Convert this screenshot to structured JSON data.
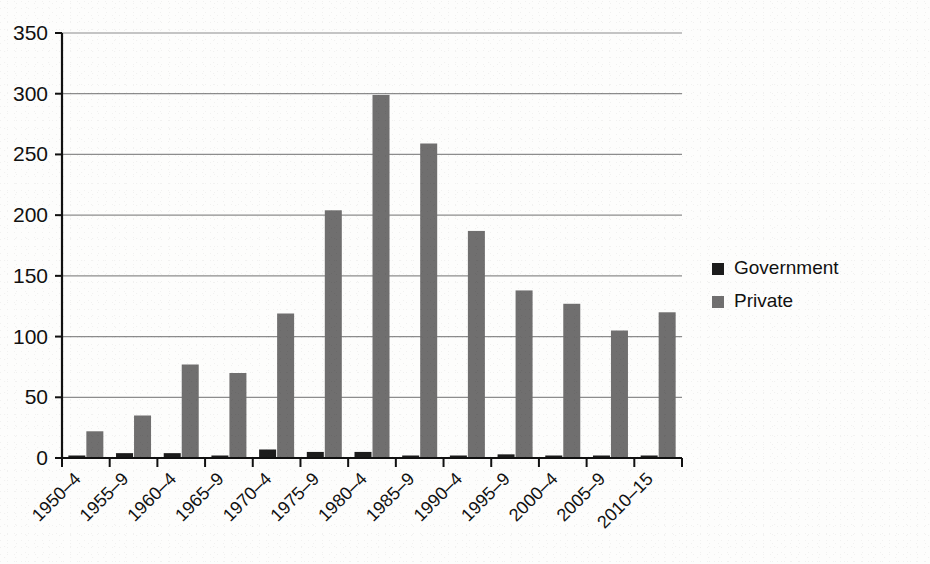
{
  "chart_data": {
    "type": "bar",
    "title": "",
    "subtitle": "",
    "xlabel": "",
    "ylabel": "",
    "ylim": [
      0,
      350
    ],
    "ytick_step": 50,
    "yticks": [
      "0",
      "50",
      "100",
      "150",
      "200",
      "250",
      "300",
      "350"
    ],
    "grid": true,
    "grid_axis": "y",
    "legend_position": "right",
    "categories": [
      "1950–4",
      "1955–9",
      "1960–4",
      "1965–9",
      "1970–4",
      "1975–9",
      "1980–4",
      "1985–9",
      "1990–4",
      "1995–9",
      "2000–4",
      "2005–9",
      "2010–15"
    ],
    "series": [
      {
        "name": "Government",
        "color": "#1c1c1c",
        "values": [
          2,
          4,
          4,
          1,
          7,
          5,
          5,
          2,
          1,
          3,
          2,
          2,
          1
        ]
      },
      {
        "name": "Private",
        "color": "#706f6f",
        "values": [
          22,
          35,
          77,
          70,
          119,
          204,
          299,
          259,
          187,
          138,
          127,
          105,
          120
        ]
      }
    ]
  },
  "legend": {
    "items": [
      {
        "label": "Government",
        "swatch_color": "#1c1c1c",
        "marker": "square-marker"
      },
      {
        "label": "Private",
        "swatch_color": "#706f6f",
        "marker": "square-marker"
      }
    ]
  },
  "axes": {
    "y_axis_name": "value-axis",
    "x_axis_name": "category-axis",
    "x_label_rotation_deg": -45
  },
  "colors": {
    "background": "#fdfdfc",
    "gridline": "#8c8c8c",
    "axis": "#111111",
    "government": "#1c1c1c",
    "private": "#706f6f"
  }
}
